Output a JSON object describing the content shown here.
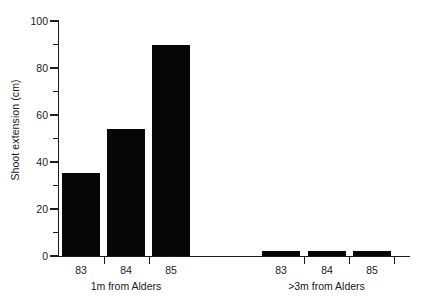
{
  "chart_data": {
    "type": "bar",
    "title": "",
    "xlabel": "",
    "ylabel": "Shoot extension (cm)",
    "ylim": [
      0,
      100
    ],
    "ytick_major": [
      0,
      20,
      40,
      60,
      80,
      100
    ],
    "ytick_minor": [
      10,
      30,
      50,
      70,
      90
    ],
    "ytick_labels": [
      "0",
      "20",
      "40",
      "60",
      "80",
      "100"
    ],
    "grid": false,
    "legend": "none",
    "groups": [
      {
        "label": "1m from Alders",
        "categories": [
          "83",
          "84",
          "85"
        ],
        "values": [
          35.5,
          54,
          90
        ]
      },
      {
        "label": ">3m from Alders",
        "categories": [
          "83",
          "84",
          "85"
        ],
        "values": [
          2,
          2,
          2
        ]
      }
    ],
    "categories": [
      "83",
      "84",
      "85",
      "83",
      "84",
      "85"
    ],
    "values": [
      35.5,
      54,
      90,
      2,
      2,
      2
    ],
    "bar_color": "#060606",
    "axis_color": "#1c1c1c",
    "background_color": "#ffffff"
  }
}
